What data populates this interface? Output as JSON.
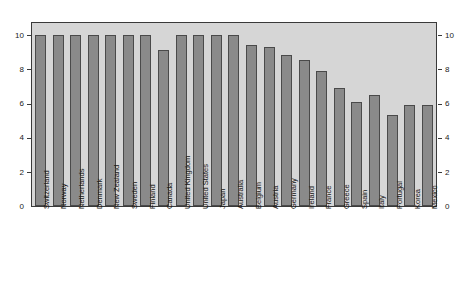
{
  "chart_data": {
    "type": "bar",
    "title": "",
    "subtitle": "",
    "xlabel": "",
    "ylabel": "",
    "ylim": [
      0,
      10.8
    ],
    "grid": false,
    "legend": null,
    "y_ticks_left": [
      "10",
      "8",
      "6",
      "4",
      "2",
      "0"
    ],
    "y_ticks_right": [
      "10",
      "8",
      "6",
      "4",
      "2",
      "0"
    ],
    "y_tick_values": [
      10,
      8,
      6,
      4,
      2,
      0
    ],
    "axis_left_position": "left",
    "axis_right_position": "right",
    "categories": [
      "Switzerland",
      "Norway",
      "Netherlands",
      "Denmark",
      "New Zealand",
      "Sweden",
      "Finland",
      "Canada",
      "United Kingdom",
      "United States",
      "Japan",
      "Australia",
      "Belgium",
      "Austria",
      "Germany",
      "Ireland",
      "France",
      "Greece",
      "Spain",
      "Italy",
      "Portugal",
      "Korea",
      "Mexico"
    ],
    "values": [
      10.0,
      10.0,
      10.0,
      10.0,
      10.0,
      10.0,
      10.0,
      9.1,
      10.0,
      10.0,
      10.0,
      10.0,
      9.4,
      9.3,
      8.8,
      8.5,
      7.9,
      6.9,
      6.1,
      6.5,
      5.3,
      5.9,
      5.9
    ],
    "bar_color": "#8a8a8a",
    "bar_edge_color": "#4a4a4a",
    "plot_background": "#d6d6d6",
    "page_background": "#ffffff",
    "frame_color": "#3a3a3a"
  }
}
